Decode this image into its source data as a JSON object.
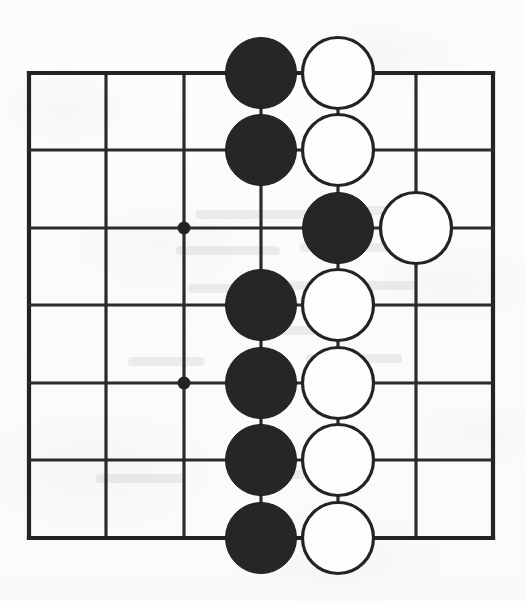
{
  "figure": {
    "kind": "go-board-diagram",
    "background_color": "#fbfbfa",
    "line_color": "#2b2b2b",
    "black_stone_color": "#262626",
    "white_stone_fill": "#fdfdfc",
    "white_stone_outline": "#232323"
  },
  "board": {
    "columns": 7,
    "rows": 7,
    "column_x": [
      29,
      106,
      184,
      261,
      338,
      416,
      493
    ],
    "row_y": [
      73,
      150,
      228,
      305,
      383,
      460,
      538
    ],
    "spacing": 77.4,
    "stone_radius": 35.5,
    "star_point_radius": 6.5,
    "star_points": [
      {
        "col": 3,
        "row": 3
      },
      {
        "col": 3,
        "row": 5
      }
    ]
  },
  "stones": [
    {
      "color": "black",
      "col": 4,
      "row": 1
    },
    {
      "color": "white",
      "col": 5,
      "row": 1
    },
    {
      "color": "black",
      "col": 4,
      "row": 2
    },
    {
      "color": "white",
      "col": 5,
      "row": 2
    },
    {
      "color": "black",
      "col": 5,
      "row": 3
    },
    {
      "color": "white",
      "col": 6,
      "row": 3
    },
    {
      "color": "black",
      "col": 4,
      "row": 4
    },
    {
      "color": "white",
      "col": 5,
      "row": 4
    },
    {
      "color": "black",
      "col": 4,
      "row": 5
    },
    {
      "color": "white",
      "col": 5,
      "row": 5
    },
    {
      "color": "black",
      "col": 4,
      "row": 6
    },
    {
      "color": "white",
      "col": 5,
      "row": 6
    },
    {
      "color": "black",
      "col": 4,
      "row": 7
    },
    {
      "color": "white",
      "col": 5,
      "row": 7
    }
  ],
  "bleed_through_marks": [
    {
      "x": 196,
      "y": 210,
      "w": 150
    },
    {
      "x": 358,
      "y": 206,
      "w": 86
    },
    {
      "x": 176,
      "y": 246,
      "w": 104
    },
    {
      "x": 300,
      "y": 243,
      "w": 120
    },
    {
      "x": 188,
      "y": 284,
      "w": 70
    },
    {
      "x": 286,
      "y": 281,
      "w": 132
    },
    {
      "x": 236,
      "y": 326,
      "w": 118
    },
    {
      "x": 128,
      "y": 357,
      "w": 76
    },
    {
      "x": 306,
      "y": 354,
      "w": 96
    },
    {
      "x": 96,
      "y": 474,
      "w": 88
    },
    {
      "x": 232,
      "y": 470,
      "w": 112
    }
  ]
}
